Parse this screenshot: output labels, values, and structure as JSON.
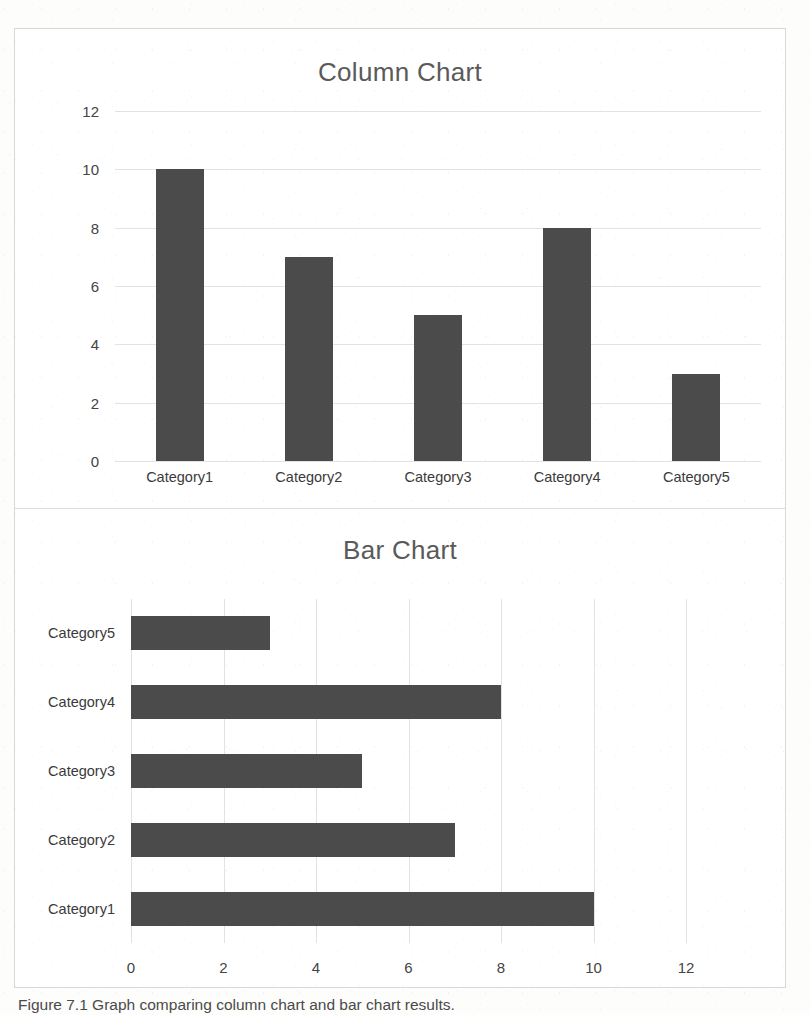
{
  "figure": {
    "caption": "Figure 7.1  Graph comparing column chart and bar chart results."
  },
  "chart_data": [
    {
      "type": "bar",
      "orientation": "vertical",
      "title": "Column Chart",
      "categories": [
        "Category1",
        "Category2",
        "Category3",
        "Category4",
        "Category5"
      ],
      "values": [
        10,
        7,
        5,
        8,
        3
      ],
      "xlabel": "",
      "ylabel": "",
      "ylim": [
        0,
        12
      ],
      "yticks": [
        0,
        2,
        4,
        6,
        8,
        10,
        12
      ],
      "ytick_labels": [
        "0",
        "2",
        "4",
        "6",
        "8",
        "10",
        "12"
      ],
      "grid": "horizontal",
      "legend": "none",
      "bar_color": "#4b4b4b",
      "gridline_color": "#e2e2e2"
    },
    {
      "type": "bar",
      "orientation": "horizontal",
      "title": "Bar Chart",
      "categories": [
        "Category1",
        "Category2",
        "Category3",
        "Category4",
        "Category5"
      ],
      "values": [
        10,
        7,
        5,
        8,
        3
      ],
      "category_order_top_to_bottom": [
        "Category5",
        "Category4",
        "Category3",
        "Category2",
        "Category1"
      ],
      "xlabel": "",
      "ylabel": "",
      "xlim": [
        0,
        12
      ],
      "xticks": [
        0,
        2,
        4,
        6,
        8,
        10,
        12
      ],
      "xtick_labels": [
        "0",
        "2",
        "4",
        "6",
        "8",
        "10",
        "12"
      ],
      "grid": "vertical",
      "legend": "none",
      "bar_color": "#4b4b4b",
      "gridline_color": "#e2e2e2"
    }
  ]
}
